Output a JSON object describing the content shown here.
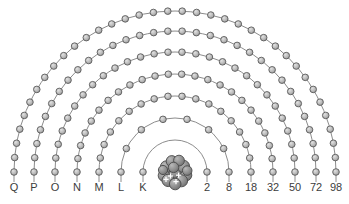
{
  "figure": {
    "background_color": "#ffffff",
    "arc_color": "#8c8c8c",
    "electron_fill": "#b4b4b4",
    "electron_stroke": "#5a5a5a",
    "nucleus_color": "#8a8a8a",
    "nucleus_stroke": "#4a4a4a",
    "label_color": "#3c3c3c"
  },
  "nucleus": {
    "name": "nucleus",
    "label": "",
    "center_x": 175,
    "center_y": 172,
    "radius": 18,
    "nucleon_count": 13,
    "proton_marks": 4
  },
  "chart_data": {
    "type": "diagram",
    "xlabel": "",
    "ylabel": "",
    "categories": [
      "K",
      "L",
      "M",
      "N",
      "O",
      "P",
      "Q"
    ],
    "values": [
      2,
      8,
      18,
      32,
      50,
      72,
      98
    ],
    "series": [
      {
        "name": "Maximum electrons per shell",
        "values": [
          2,
          8,
          18,
          32,
          50,
          72,
          98
        ]
      }
    ],
    "legend_position": "none",
    "grid": false
  },
  "shells": [
    {
      "letter": "K",
      "count_label": "2",
      "electrons": 2,
      "radius": 32,
      "letter_x": 143,
      "count_x": 207
    },
    {
      "letter": "L",
      "count_label": "8",
      "electrons": 8,
      "radius": 54,
      "letter_x": 121,
      "count_x": 229
    },
    {
      "letter": "M",
      "count_label": "18",
      "electrons": 18,
      "radius": 76,
      "letter_x": 99,
      "count_x": 251
    },
    {
      "letter": "N",
      "count_label": "32",
      "electrons": 24,
      "radius": 98,
      "letter_x": 77,
      "count_x": 273
    },
    {
      "letter": "O",
      "count_label": "50",
      "electrons": 28,
      "radius": 120,
      "letter_x": 55,
      "count_x": 295
    },
    {
      "letter": "P",
      "count_label": "72",
      "electrons": 32,
      "radius": 141,
      "letter_x": 34,
      "count_x": 316
    },
    {
      "letter": "Q",
      "count_label": "98",
      "electrons": 36,
      "radius": 161,
      "letter_x": 14,
      "count_x": 336
    }
  ],
  "labels": {
    "letters": [
      "Q",
      "P",
      "O",
      "N",
      "M",
      "L",
      "K"
    ],
    "counts": [
      "2",
      "8",
      "18",
      "32",
      "50",
      "72",
      "98"
    ],
    "baseline_y": 191
  }
}
